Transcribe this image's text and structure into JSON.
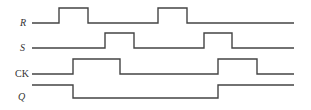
{
  "diagram": {
    "type": "timing-diagram",
    "stroke_color": "#444444",
    "x_start": 32,
    "x_end": 294,
    "signals": [
      {
        "name": "R",
        "label": "R",
        "italic": true,
        "label_pos": [
          20,
          26
        ],
        "low_y": 23,
        "high_y": 8,
        "initial": "low",
        "transitions": [
          59,
          88,
          158,
          187
        ]
      },
      {
        "name": "S",
        "label": "S",
        "italic": true,
        "label_pos": [
          20,
          51
        ],
        "low_y": 48,
        "high_y": 33,
        "initial": "low",
        "transitions": [
          105,
          134,
          204,
          232
        ]
      },
      {
        "name": "CK",
        "label": "CK",
        "italic": false,
        "label_pos": [
          15,
          77
        ],
        "low_y": 74,
        "high_y": 59,
        "initial": "low",
        "transitions": [
          73,
          120,
          218,
          257
        ]
      },
      {
        "name": "Q",
        "label": "Q",
        "italic": true,
        "label_pos": [
          18,
          100
        ],
        "low_y": 98,
        "high_y": 85,
        "initial": "high",
        "transitions": [
          73,
          218
        ]
      }
    ]
  }
}
